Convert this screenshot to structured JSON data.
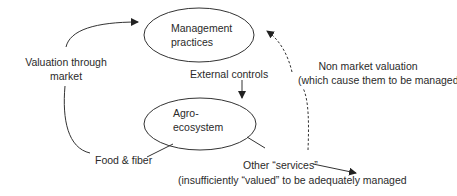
{
  "nodes": {
    "management": {
      "line1": "Management",
      "line2": "practices"
    },
    "agro": {
      "line1": "Agro-",
      "line2": "ecosystem"
    }
  },
  "labels": {
    "valuation_market_line1": "Valuation through",
    "valuation_market_line2": "market",
    "external_controls": "External controls",
    "food_fiber": "Food & fiber",
    "non_market_line1": "Non market valuation",
    "non_market_line2": "(which cause them to be managed)",
    "other_services_line1": "Other “services”",
    "other_services_line2": "(insufficiently “valued” to be adequately managed"
  },
  "colors": {
    "stroke": "#333333",
    "text": "#2a2a2a",
    "background": "#ffffff"
  }
}
